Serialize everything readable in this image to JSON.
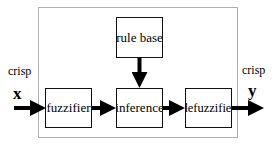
{
  "diagram": {
    "blocks": {
      "rule_base": "rule base",
      "fuzzifier": "fuzzifier",
      "inference": "inference",
      "defuzzifier": "defuzzifier"
    },
    "input": {
      "label": "crisp",
      "variable": "x"
    },
    "output": {
      "label": "crisp",
      "variable": "y"
    },
    "connections": [
      {
        "from": "input x",
        "to": "fuzzifier"
      },
      {
        "from": "fuzzifier",
        "to": "inference"
      },
      {
        "from": "rule base",
        "to": "inference"
      },
      {
        "from": "inference",
        "to": "defuzzifier"
      },
      {
        "from": "defuzzifier",
        "to": "output y"
      }
    ],
    "colors": {
      "stroke": "#000000",
      "frame": "#b0b0b0",
      "background": "#ffffff"
    }
  }
}
